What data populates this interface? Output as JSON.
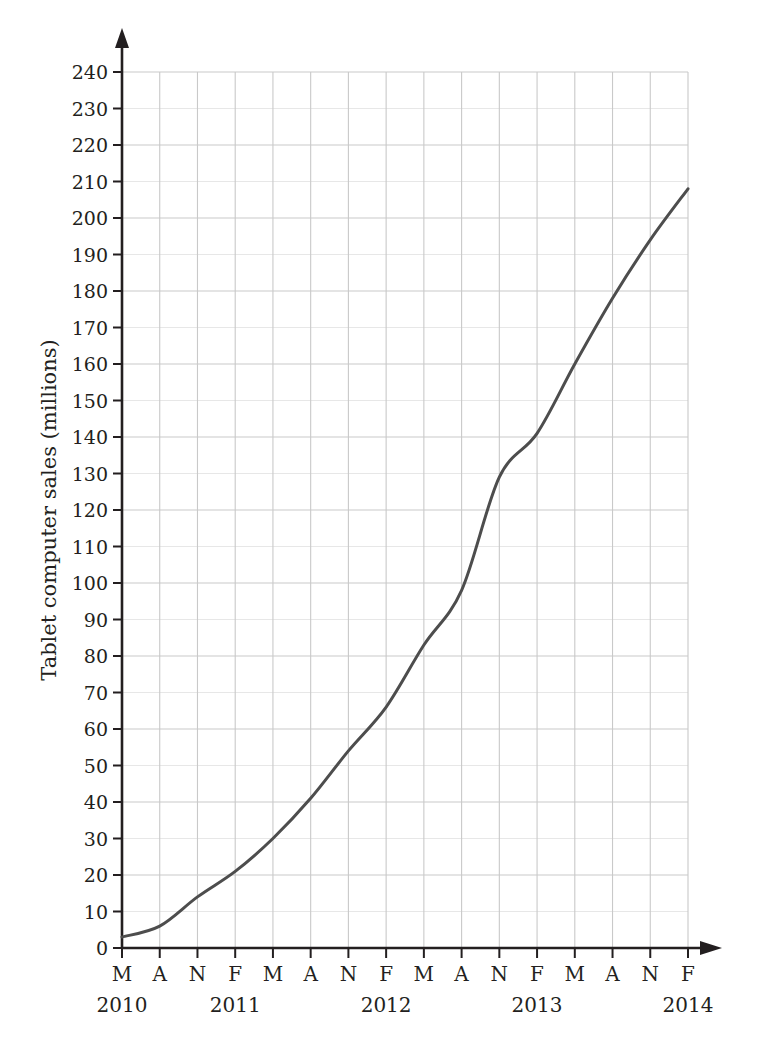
{
  "chart_data": {
    "type": "line",
    "title": "",
    "xlabel": "",
    "ylabel": "Tablet computer sales (millions)",
    "ylim": [
      0,
      240
    ],
    "ytick_step": 10,
    "yticks": [
      0,
      10,
      20,
      30,
      40,
      50,
      60,
      70,
      80,
      90,
      100,
      110,
      120,
      130,
      140,
      150,
      160,
      170,
      180,
      190,
      200,
      210,
      220,
      230,
      240
    ],
    "grid": true,
    "legend": "none",
    "line_color": "#4d4d4d",
    "grid_color": "#c9c9c9",
    "axis_color": "#231f20",
    "categories": [
      "M",
      "A",
      "N",
      "F",
      "M",
      "A",
      "N",
      "F",
      "M",
      "A",
      "N",
      "F",
      "M",
      "A",
      "N",
      "F"
    ],
    "x_years": [
      {
        "label": "2010",
        "tick_index": 0
      },
      {
        "label": "2011",
        "tick_index": 3
      },
      {
        "label": "2012",
        "tick_index": 7
      },
      {
        "label": "2013",
        "tick_index": 11
      },
      {
        "label": "2014",
        "tick_index": 15
      }
    ],
    "x_points": [
      "M 2010",
      "A 2010",
      "N 2010",
      "F 2011",
      "M 2011",
      "A 2011",
      "N 2011",
      "F 2012",
      "M 2012",
      "A 2012",
      "N 2012",
      "F 2013",
      "M 2013",
      "A 2013",
      "N 2013",
      "F 2014"
    ],
    "values": [
      3,
      6,
      14,
      21,
      30,
      41,
      54,
      66,
      83,
      98,
      129,
      141,
      160,
      178,
      194,
      208
    ]
  }
}
